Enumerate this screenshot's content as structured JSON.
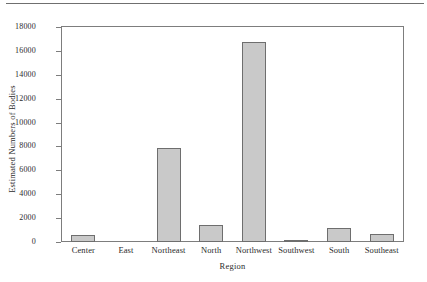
{
  "decor": {
    "top_rule": "horizontal-rule"
  },
  "chart_data": {
    "type": "bar",
    "title": "",
    "xlabel": "Region",
    "ylabel": "Estimated Numbers of Bodies",
    "categories": [
      "Center",
      "East",
      "Northeast",
      "North",
      "Northwest",
      "Southwest",
      "South",
      "Southeast"
    ],
    "values": [
      580,
      0,
      7900,
      1450,
      16750,
      180,
      1180,
      690
    ],
    "ylim": [
      0,
      18000
    ],
    "yticks": [
      0,
      2000,
      4000,
      6000,
      8000,
      10000,
      12000,
      14000,
      16000,
      18000
    ],
    "ytick_labels": [
      "0",
      "2000",
      "4000",
      "6000",
      "8000",
      "10000",
      "12000",
      "14000",
      "16000",
      "18000"
    ],
    "grid": false,
    "legend": null,
    "bar_fill_color": "#c9c9c9",
    "bar_border_color": "#6e6e6e",
    "axis_color": "#7d7d7d",
    "background_color": "#ffffff"
  }
}
